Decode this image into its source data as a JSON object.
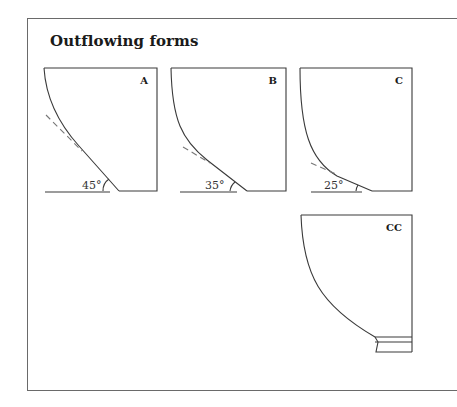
{
  "title": "Outflowing forms",
  "panels": [
    {
      "id": "A",
      "label": "A",
      "angle": "45°"
    },
    {
      "id": "B",
      "label": "B",
      "angle": "35°"
    },
    {
      "id": "C",
      "label": "C",
      "angle": "25°"
    },
    {
      "id": "CC",
      "label": "CC",
      "angle": ""
    }
  ],
  "colors": {
    "line": "#3a3a3a",
    "frame": "#6a6a6a",
    "dashed": "#777777"
  }
}
